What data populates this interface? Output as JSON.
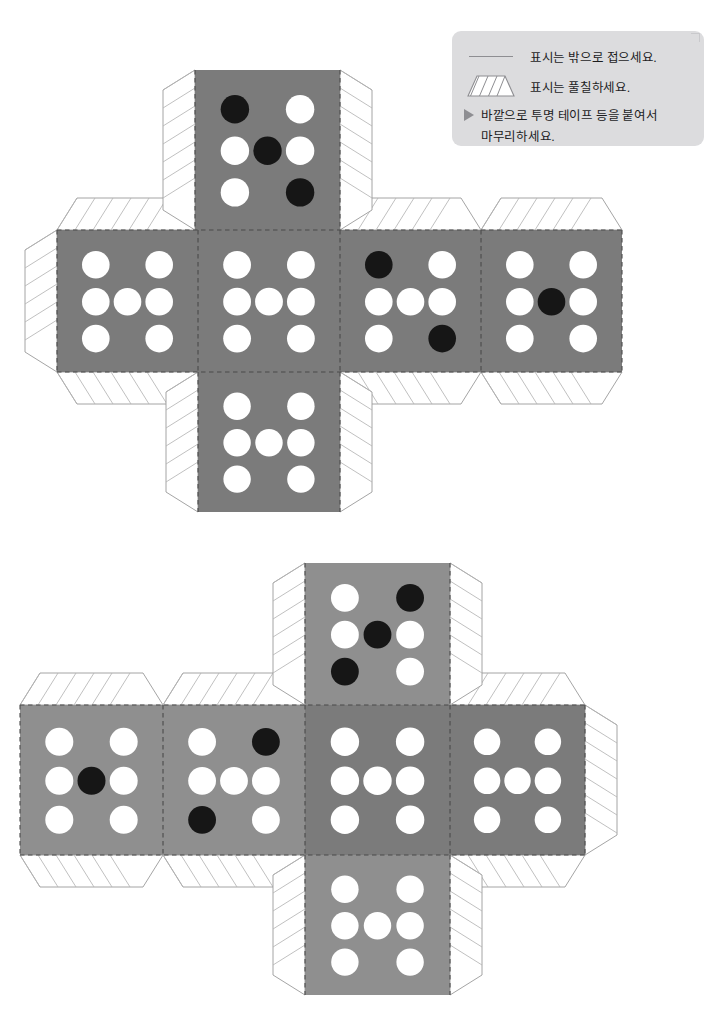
{
  "legend": {
    "rows": [
      {
        "symbol": "dashed-fold-line-icon",
        "text": "표시는 밖으로 접으세요."
      },
      {
        "symbol": "glue-tab-hatched-icon",
        "text": "표시는 풀칠하세요."
      }
    ],
    "note": {
      "marker": "triangle-bullet-icon",
      "line1": "바깥으로 투명 테이프 등을 붙여서",
      "line2": "마무리하세요."
    }
  },
  "colors": {
    "face_fill": "#7b7b7b",
    "face_fill_light": "#8f8f8f",
    "pip_white": "#ffffff",
    "pip_black": "#161616",
    "fold_line": "#4a4a4a",
    "tab_outline": "#9a9a9a",
    "tab_hatch": "#b5b5b5",
    "legend_bg": "#dcdcde",
    "legend_text": "#1d1d1f"
  },
  "nets": [
    {
      "id": "dice-net-top",
      "name": "dice-net-upper",
      "faces": [
        {
          "id": "net1-face-top",
          "name": "face-top",
          "x": 195,
          "y": 70,
          "w": 145,
          "h": 160,
          "fill": "#7b7b7b",
          "pips": [
            {
              "pos": "top-left",
              "color": "black"
            },
            {
              "pos": "top-right",
              "color": "white"
            },
            {
              "pos": "mid-left",
              "color": "white"
            },
            {
              "pos": "center",
              "color": "black"
            },
            {
              "pos": "mid-right",
              "color": "white"
            },
            {
              "pos": "bottom-left",
              "color": "white"
            },
            {
              "pos": "bottom-right",
              "color": "black"
            }
          ]
        },
        {
          "id": "net1-face-1",
          "name": "face-row-1",
          "x": 57,
          "y": 230,
          "w": 141,
          "h": 142,
          "fill": "#7b7b7b",
          "pips": [
            {
              "pos": "top-left",
              "color": "white"
            },
            {
              "pos": "top-right",
              "color": "white"
            },
            {
              "pos": "mid-left",
              "color": "white"
            },
            {
              "pos": "center",
              "color": "white"
            },
            {
              "pos": "mid-right",
              "color": "white"
            },
            {
              "pos": "bottom-left",
              "color": "white"
            },
            {
              "pos": "bottom-right",
              "color": "white"
            }
          ]
        },
        {
          "id": "net1-face-2",
          "name": "face-row-2",
          "x": 198,
          "y": 230,
          "w": 142,
          "h": 142,
          "fill": "#7b7b7b",
          "pips": [
            {
              "pos": "top-left",
              "color": "white"
            },
            {
              "pos": "top-right",
              "color": "white"
            },
            {
              "pos": "mid-left",
              "color": "white"
            },
            {
              "pos": "center",
              "color": "white"
            },
            {
              "pos": "mid-right",
              "color": "white"
            },
            {
              "pos": "bottom-left",
              "color": "white"
            },
            {
              "pos": "bottom-right",
              "color": "white"
            }
          ]
        },
        {
          "id": "net1-face-3",
          "name": "face-row-3",
          "x": 340,
          "y": 230,
          "w": 141,
          "h": 142,
          "fill": "#7b7b7b",
          "pips": [
            {
              "pos": "top-left",
              "color": "black"
            },
            {
              "pos": "top-right",
              "color": "white"
            },
            {
              "pos": "mid-left",
              "color": "white"
            },
            {
              "pos": "center",
              "color": "white"
            },
            {
              "pos": "mid-right",
              "color": "white"
            },
            {
              "pos": "bottom-left",
              "color": "white"
            },
            {
              "pos": "bottom-right",
              "color": "black"
            }
          ]
        },
        {
          "id": "net1-face-4",
          "name": "face-row-4",
          "x": 481,
          "y": 230,
          "w": 141,
          "h": 142,
          "fill": "#7b7b7b",
          "pips": [
            {
              "pos": "top-left",
              "color": "white"
            },
            {
              "pos": "top-right",
              "color": "white"
            },
            {
              "pos": "mid-left",
              "color": "white"
            },
            {
              "pos": "center",
              "color": "black"
            },
            {
              "pos": "mid-right",
              "color": "white"
            },
            {
              "pos": "bottom-left",
              "color": "white"
            },
            {
              "pos": "bottom-right",
              "color": "white"
            }
          ]
        },
        {
          "id": "net1-face-bottom",
          "name": "face-bottom",
          "x": 198,
          "y": 372,
          "w": 142,
          "h": 140,
          "fill": "#7b7b7b",
          "pips": [
            {
              "pos": "top-left",
              "color": "white"
            },
            {
              "pos": "top-right",
              "color": "white"
            },
            {
              "pos": "mid-left",
              "color": "white"
            },
            {
              "pos": "center",
              "color": "white"
            },
            {
              "pos": "mid-right",
              "color": "white"
            },
            {
              "pos": "bottom-left",
              "color": "white"
            },
            {
              "pos": "bottom-right",
              "color": "white"
            }
          ]
        }
      ]
    },
    {
      "id": "dice-net-bottom",
      "name": "dice-net-lower",
      "faces": [
        {
          "id": "net2-face-top",
          "name": "face-top",
          "x": 305,
          "y": 563,
          "w": 145,
          "h": 142,
          "fill": "#8f8f8f",
          "pips": [
            {
              "pos": "top-left",
              "color": "white"
            },
            {
              "pos": "top-right",
              "color": "black"
            },
            {
              "pos": "mid-left",
              "color": "white"
            },
            {
              "pos": "center",
              "color": "black"
            },
            {
              "pos": "mid-right",
              "color": "white"
            },
            {
              "pos": "bottom-left",
              "color": "black"
            },
            {
              "pos": "bottom-right",
              "color": "white"
            }
          ]
        },
        {
          "id": "net2-face-1",
          "name": "face-row-1",
          "x": 20,
          "y": 705,
          "w": 143,
          "h": 150,
          "fill": "#8f8f8f",
          "pips": [
            {
              "pos": "top-left",
              "color": "white"
            },
            {
              "pos": "top-right",
              "color": "white"
            },
            {
              "pos": "mid-left",
              "color": "white"
            },
            {
              "pos": "center",
              "color": "black"
            },
            {
              "pos": "mid-right",
              "color": "white"
            },
            {
              "pos": "bottom-left",
              "color": "white"
            },
            {
              "pos": "bottom-right",
              "color": "white"
            }
          ]
        },
        {
          "id": "net2-face-2",
          "name": "face-row-2",
          "x": 163,
          "y": 705,
          "w": 142,
          "h": 150,
          "fill": "#8f8f8f",
          "pips": [
            {
              "pos": "top-left",
              "color": "white"
            },
            {
              "pos": "top-right",
              "color": "black"
            },
            {
              "pos": "mid-left",
              "color": "white"
            },
            {
              "pos": "center",
              "color": "white"
            },
            {
              "pos": "mid-right",
              "color": "white"
            },
            {
              "pos": "bottom-left",
              "color": "black"
            },
            {
              "pos": "bottom-right",
              "color": "white"
            }
          ]
        },
        {
          "id": "net2-face-3",
          "name": "face-row-3",
          "x": 305,
          "y": 705,
          "w": 145,
          "h": 150,
          "fill": "#7b7b7b",
          "pips": [
            {
              "pos": "top-left",
              "color": "white"
            },
            {
              "pos": "top-right",
              "color": "white"
            },
            {
              "pos": "mid-left",
              "color": "white"
            },
            {
              "pos": "center",
              "color": "white"
            },
            {
              "pos": "mid-right",
              "color": "white"
            },
            {
              "pos": "bottom-left",
              "color": "white"
            },
            {
              "pos": "bottom-right",
              "color": "white"
            }
          ]
        },
        {
          "id": "net2-face-4",
          "name": "face-row-4",
          "x": 450,
          "y": 705,
          "w": 135,
          "h": 150,
          "fill": "#7b7b7b",
          "pips": [
            {
              "pos": "top-left",
              "color": "white"
            },
            {
              "pos": "top-right",
              "color": "white"
            },
            {
              "pos": "mid-left",
              "color": "white"
            },
            {
              "pos": "center",
              "color": "white"
            },
            {
              "pos": "mid-right",
              "color": "white"
            },
            {
              "pos": "bottom-left",
              "color": "white"
            },
            {
              "pos": "bottom-right",
              "color": "white"
            }
          ]
        },
        {
          "id": "net2-face-bottom",
          "name": "face-bottom",
          "x": 305,
          "y": 855,
          "w": 145,
          "h": 140,
          "fill": "#8f8f8f",
          "pips": [
            {
              "pos": "top-left",
              "color": "white"
            },
            {
              "pos": "top-right",
              "color": "white"
            },
            {
              "pos": "mid-left",
              "color": "white"
            },
            {
              "pos": "center",
              "color": "white"
            },
            {
              "pos": "mid-right",
              "color": "white"
            },
            {
              "pos": "bottom-left",
              "color": "white"
            },
            {
              "pos": "bottom-right",
              "color": "white"
            }
          ]
        }
      ],
      "right_tab": true
    }
  ]
}
